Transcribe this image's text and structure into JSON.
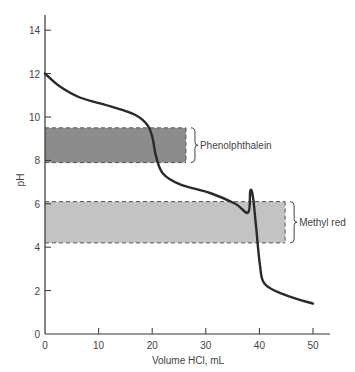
{
  "chart_data": {
    "type": "line",
    "title": "",
    "xlabel": "Volume HCl, mL",
    "ylabel": "pH",
    "xlim": [
      0,
      52
    ],
    "ylim": [
      0,
      15
    ],
    "x_ticks": [
      0,
      10,
      20,
      30,
      40,
      50
    ],
    "y_ticks": [
      0,
      2,
      4,
      6,
      8,
      10,
      12,
      14
    ],
    "grid": false,
    "series": [
      {
        "name": "Titration curve",
        "color": "#2a2a2a",
        "x": [
          0,
          2.8,
          6.5,
          12.1,
          16.8,
          19.2,
          20.1,
          20.7,
          22.0,
          25.2,
          30.8,
          35.5,
          37.9,
          38.3,
          38.8,
          39.4,
          40.1,
          41.0,
          44.8,
          50.0
        ],
        "y": [
          12.0,
          11.4,
          10.9,
          10.5,
          10.1,
          9.6,
          9.0,
          8.2,
          7.4,
          6.9,
          6.5,
          6.0,
          5.6,
          6.6,
          6.3,
          4.9,
          3.2,
          2.3,
          1.8,
          1.4
        ]
      }
    ],
    "bands": [
      {
        "label": "Phenolphthalein",
        "ph_low": 7.9,
        "ph_high": 9.5,
        "x_end": 26.3,
        "color": "#8c8c8c"
      },
      {
        "label": "Methyl red",
        "ph_low": 4.2,
        "ph_high": 6.1,
        "x_end": 44.8,
        "color": "#c3c3c3"
      }
    ]
  },
  "labels": {
    "x_axis": "Volume HCl, mL",
    "y_axis": "pH",
    "band1": "Phenolphthalein",
    "band2": "Methyl red",
    "xt": [
      "0",
      "10",
      "20",
      "30",
      "40",
      "50"
    ],
    "yt": [
      "0",
      "2",
      "4",
      "6",
      "8",
      "10",
      "12",
      "14"
    ]
  }
}
